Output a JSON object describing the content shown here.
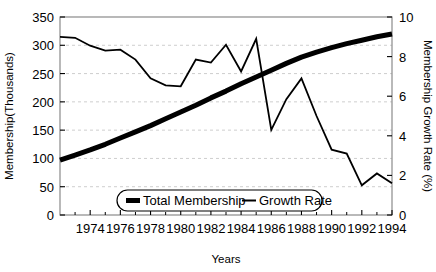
{
  "chart_data": {
    "type": "line",
    "title": "",
    "xlabel": "Years",
    "ylabel": "Membership(Thousands)",
    "y2label": "Membership Growth Rate (%)",
    "xlim": [
      1972,
      1994
    ],
    "ylim": [
      0,
      350
    ],
    "y2lim": [
      0,
      10
    ],
    "grid": true,
    "grid_axis": "y",
    "legend_position": "bottom-center",
    "x_major_ticks": [
      1974,
      1976,
      1978,
      1980,
      1982,
      1984,
      1986,
      1988,
      1990,
      1992,
      1994
    ],
    "x_minor_ticks": [
      1973,
      1975,
      1977,
      1979,
      1981,
      1983,
      1985,
      1987,
      1989,
      1991,
      1993
    ],
    "x_tick_labels": [
      "1974",
      "1976",
      "1978",
      "1980",
      "1982",
      "1984",
      "1986",
      "1988",
      "1990",
      "1992",
      "1994"
    ],
    "y_ticks": [
      0,
      50,
      100,
      150,
      200,
      250,
      300,
      350
    ],
    "y_tick_labels": [
      "0",
      "50",
      "100",
      "150",
      "200",
      "250",
      "300",
      "350"
    ],
    "y2_ticks": [
      0,
      2,
      4,
      6,
      8,
      10
    ],
    "y2_tick_labels": [
      "0",
      "2",
      "4",
      "6",
      "8",
      "10"
    ],
    "x": [
      1972,
      1973,
      1974,
      1975,
      1976,
      1977,
      1978,
      1979,
      1980,
      1981,
      1982,
      1983,
      1984,
      1985,
      1986,
      1987,
      1988,
      1989,
      1990,
      1991,
      1992,
      1993,
      1994
    ],
    "series": [
      {
        "name": "Total Membership",
        "axis": "left",
        "style": "thick",
        "color": "#000000",
        "values": [
          97,
          106,
          115,
          125,
          136,
          147,
          158,
          170,
          182,
          194,
          207,
          219,
          232,
          244,
          256,
          268,
          279,
          288,
          296,
          303,
          309,
          315,
          320
        ]
      },
      {
        "name": "Growth Rate",
        "axis": "right",
        "style": "thin",
        "color": "#000000",
        "values": [
          9.0,
          8.95,
          8.55,
          8.3,
          8.35,
          7.85,
          6.9,
          6.55,
          6.5,
          7.85,
          7.7,
          8.6,
          7.25,
          8.9,
          4.3,
          5.85,
          6.9,
          5.0,
          3.3,
          3.1,
          1.5,
          2.1,
          1.6
        ]
      }
    ]
  },
  "legend": {
    "items": [
      {
        "label": "Total Membership",
        "marker": "thick-line"
      },
      {
        "label": "Growth Rate",
        "marker": "thin-line"
      }
    ]
  }
}
